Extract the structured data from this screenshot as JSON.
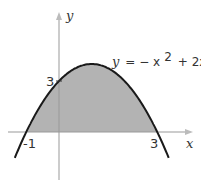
{
  "chart_data": {
    "type": "area",
    "title": "",
    "function": "y = -x^2 + 2x + 3",
    "equation_label": {
      "y": "y",
      "eq": "= − x",
      "sup": "2",
      "rest": "+ 2x + 3"
    },
    "xlabel": "x",
    "ylabel": "y",
    "x_ticks": [
      "-1",
      "3"
    ],
    "y_ticks": [
      "3"
    ],
    "x": [
      -1,
      -0.5,
      0,
      0.5,
      1,
      1.5,
      2,
      2.5,
      3
    ],
    "values": [
      0,
      1.75,
      3,
      3.75,
      4,
      3.75,
      3,
      1.75,
      0
    ],
    "shaded_region": "area under curve between x=-1 and x=3",
    "xlim": [
      -1.5,
      4
    ],
    "ylim": [
      -2.7,
      5
    ],
    "grid": false,
    "colors": {
      "fill": "#b3b3b3",
      "curve": "#1a1a1a",
      "axis": "#999999"
    }
  }
}
